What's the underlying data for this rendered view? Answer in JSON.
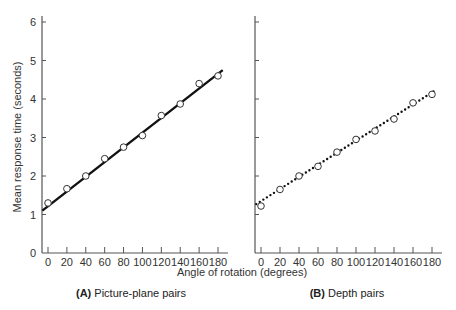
{
  "chart_data": [
    {
      "type": "scatter",
      "panel": "A",
      "caption_letter": "(A)",
      "caption_text": "Picture-plane pairs",
      "xlabel": "Angle of rotation (degrees)",
      "ylabel": "Mean response time (seconds)",
      "x": [
        0,
        20,
        40,
        60,
        80,
        100,
        120,
        140,
        160,
        180
      ],
      "values": [
        1.3,
        1.67,
        2.0,
        2.45,
        2.75,
        3.05,
        3.57,
        3.87,
        4.4,
        4.6
      ],
      "fit_line": {
        "style": "solid",
        "start": [
          -6,
          1.1
        ],
        "end": [
          185,
          4.75
        ]
      },
      "xlim": [
        0,
        180
      ],
      "ylim": [
        0,
        6
      ],
      "x_ticks": [
        "0",
        "20",
        "40",
        "60",
        "80",
        "100",
        "120",
        "140",
        "160",
        "180"
      ],
      "y_ticks": [
        "0",
        "1",
        "2",
        "3",
        "4",
        "5",
        "6"
      ],
      "grid": false,
      "marker": "open-circle"
    },
    {
      "type": "scatter",
      "panel": "B",
      "caption_letter": "(B)",
      "caption_text": "Depth pairs",
      "xlabel": "Angle of rotation (degrees)",
      "ylabel": "",
      "x": [
        0,
        20,
        40,
        60,
        80,
        100,
        120,
        140,
        160,
        180
      ],
      "values": [
        1.22,
        1.65,
        2.0,
        2.25,
        2.62,
        2.95,
        3.17,
        3.48,
        3.9,
        4.12
      ],
      "fit_line": {
        "style": "dotted",
        "start": [
          -5,
          1.27
        ],
        "end": [
          185,
          4.25
        ]
      },
      "xlim": [
        0,
        180
      ],
      "ylim": [
        0,
        6
      ],
      "x_ticks": [
        "0",
        "20",
        "40",
        "60",
        "80",
        "100",
        "120",
        "140",
        "160",
        "180"
      ],
      "y_ticks": [],
      "grid": false,
      "marker": "open-circle"
    }
  ],
  "labels": {
    "ylabel": "Mean response time (seconds)",
    "xlabel": "Angle of rotation (degrees)",
    "panel_a_letter": "(A)",
    "panel_a_text": " Picture-plane pairs",
    "panel_b_letter": "(B)",
    "panel_b_text": " Depth pairs"
  },
  "colors": {
    "axis": "#555555",
    "line": "#111111",
    "marker_fill": "#ffffff",
    "marker_stroke": "#333333"
  }
}
